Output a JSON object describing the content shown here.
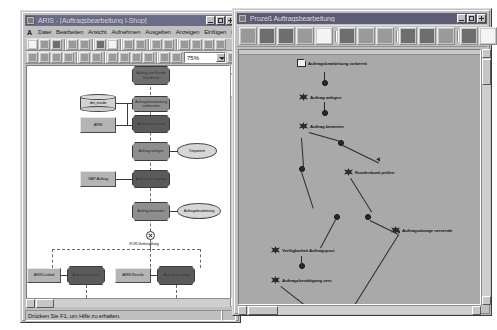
{
  "left_window": {
    "title": "ARIS - [Auftragsbearbeitung I-Shop]",
    "menu": {
      "logo": "A",
      "items": [
        "Datei",
        "Bearbeiten",
        "Ansicht",
        "Aufnehmen",
        "Ausgeben",
        "Anzeigen",
        "Einfügen",
        "Extras"
      ]
    },
    "zoom_combo": {
      "value": "75%"
    },
    "status": {
      "hint": "Drücken Sie F1, um Hilfe zu erhalten."
    },
    "diagram": {
      "nodes": [
        {
          "id": "n1",
          "label": "Auftrag von Kunde Kundensit",
          "type": "function"
        },
        {
          "id": "n2",
          "label": "Auftragsbearbeitung vorbereiten",
          "type": "function"
        },
        {
          "id": "n3",
          "label": "Auftrag ist erfasst",
          "type": "function"
        },
        {
          "id": "n4",
          "label": "Auftrag anlegen",
          "type": "function"
        },
        {
          "id": "n5",
          "label": "Auftrag ist angelegt",
          "type": "function"
        },
        {
          "id": "n6",
          "label": "Auftrag bewerten",
          "type": "function"
        },
        {
          "id": "n7",
          "label": "Auftrag ist bewertet",
          "type": "function"
        },
        {
          "id": "n8",
          "label": "Auftrag abgelehnt",
          "type": "function"
        },
        {
          "id": "n9",
          "label": "Auftrag bestätigt",
          "type": "function"
        }
      ],
      "data_nodes": [
        {
          "id": "d1",
          "label": "dm_results",
          "type": "database"
        },
        {
          "id": "d2",
          "label": "ARIS",
          "type": "rectangle"
        },
        {
          "id": "d3",
          "label": "SAP-Auftrag",
          "type": "rectangle"
        },
        {
          "id": "d4",
          "label": "ARIS-Leitfad",
          "type": "rectangle"
        },
        {
          "id": "d5",
          "label": "ARIS-Results",
          "type": "rectangle"
        }
      ],
      "roles": [
        {
          "id": "r1",
          "label": "Disponent"
        },
        {
          "id": "r2",
          "label": "Auftragsbearbeitung"
        }
      ],
      "connector": {
        "type": "XOR",
        "label": "XOR-Verknüpfung"
      }
    }
  },
  "right_window": {
    "title": "Prozeß Auftragsbearbeitung",
    "nodes": [
      {
        "label": "Auftragsbearbeitung vorbereit",
        "type": "document"
      },
      {
        "label": "Auftrag anlegen",
        "type": "function"
      },
      {
        "label": "Auftrag bewerten",
        "type": "function"
      },
      {
        "label": "Kundenbonit prüfen",
        "type": "function"
      },
      {
        "label": "Verfügbarkeit Auftragsposi",
        "type": "function"
      },
      {
        "label": "Auftragsabsage versende",
        "type": "function"
      },
      {
        "label": "Auftragsbestätigung vers",
        "type": "function"
      },
      {
        "label": "End-Activity",
        "type": "function"
      }
    ]
  },
  "colors": {
    "desktop": "#ffffff",
    "chrome": "#c0c0c0",
    "titlebar": "#6b6b8a",
    "canvas": "#ffffff",
    "process_canvas": "#a9a9a9",
    "node_fill": "#6e6e6e"
  }
}
